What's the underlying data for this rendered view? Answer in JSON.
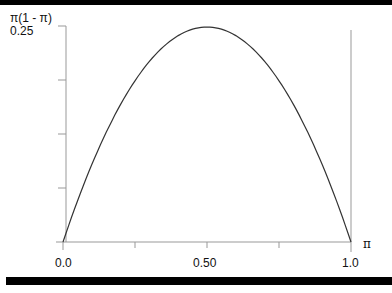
{
  "chart_data": {
    "type": "line",
    "title": "",
    "xlabel": "π",
    "ylabel": "π(1 - π)",
    "x": [
      0.0,
      0.05,
      0.1,
      0.15,
      0.2,
      0.25,
      0.3,
      0.35,
      0.4,
      0.45,
      0.5,
      0.55,
      0.6,
      0.65,
      0.7,
      0.75,
      0.8,
      0.85,
      0.9,
      0.95,
      1.0
    ],
    "series": [
      {
        "name": "π(1 - π)",
        "values": [
          0.0,
          0.0475,
          0.09,
          0.1275,
          0.16,
          0.1875,
          0.21,
          0.2275,
          0.24,
          0.2475,
          0.25,
          0.2475,
          0.24,
          0.2275,
          0.21,
          0.1875,
          0.16,
          0.1275,
          0.09,
          0.0475,
          0.0
        ]
      }
    ],
    "xlim": [
      0.0,
      1.0
    ],
    "ylim": [
      0.0,
      0.25
    ],
    "x_tick_labels": [
      "0.0",
      "0.50",
      "1.0"
    ],
    "y_tick_labels": [
      "0.25"
    ],
    "grid": false,
    "legend": "none"
  },
  "labels": {
    "y_axis_title": "π(1 - π)",
    "y_top_tick": "0.25",
    "x_axis_title": "π",
    "x_tick_0": "0.0",
    "x_tick_mid": "0.50",
    "x_tick_1": "1.0"
  }
}
